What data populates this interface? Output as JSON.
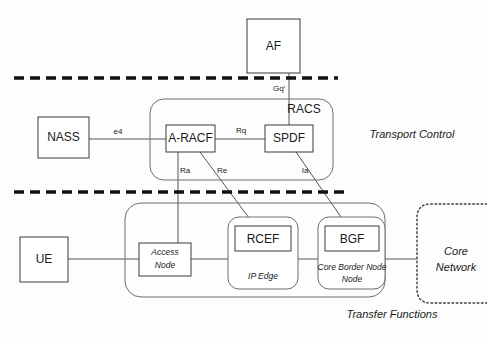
{
  "diagram": {
    "zones": [
      {
        "id": "transport-control",
        "label": "Transport Control"
      },
      {
        "id": "transfer-functions",
        "label": "Transfer Functions"
      }
    ],
    "groups": [
      {
        "id": "racs",
        "label": "RACS"
      },
      {
        "id": "ip-edge",
        "label": "IP Edge"
      },
      {
        "id": "core-border-node",
        "label": "Core Border Node"
      },
      {
        "id": "core-network",
        "label_line1": "Core",
        "label_line2": "Network"
      }
    ],
    "nodes": [
      {
        "id": "af",
        "label": "AF"
      },
      {
        "id": "nass",
        "label": "NASS"
      },
      {
        "id": "a-racf",
        "label": "A-RACF"
      },
      {
        "id": "spdf",
        "label": "SPDF"
      },
      {
        "id": "ue",
        "label": "UE"
      },
      {
        "id": "access-node",
        "label_line1": "Access",
        "label_line2": "Node"
      },
      {
        "id": "rcef",
        "label": "RCEF"
      },
      {
        "id": "bgf",
        "label": "BGF"
      }
    ],
    "interfaces": [
      {
        "id": "gq",
        "label": "Gq′",
        "from": "af",
        "to": "spdf"
      },
      {
        "id": "e4",
        "label": "e4",
        "from": "nass",
        "to": "a-racf"
      },
      {
        "id": "rq",
        "label": "Rq",
        "from": "a-racf",
        "to": "spdf"
      },
      {
        "id": "ra",
        "label": "Ra",
        "from": "a-racf",
        "to": "access-node"
      },
      {
        "id": "re",
        "label": "Re",
        "from": "a-racf",
        "to": "rcef"
      },
      {
        "id": "ia",
        "label": "Ia",
        "from": "spdf",
        "to": "bgf"
      }
    ],
    "colors": {
      "background": "#fdfdfd",
      "box_stroke": "#3a3a3a",
      "container_stroke": "#6e6e6e",
      "link_stroke": "#555555",
      "divider_stroke": "#111111",
      "text": "#1a1a1a"
    }
  }
}
